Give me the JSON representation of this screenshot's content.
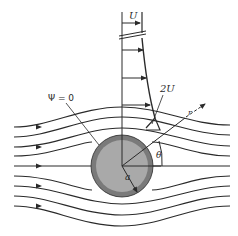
{
  "diagram": {
    "labels": {
      "free_stream": "U",
      "max_velocity": "2U",
      "dividing_streamline": "Ψ = 0",
      "radial_coordinate": "r",
      "angle": "θ",
      "radius": "a"
    },
    "colors": {
      "line": "#2a2a2a",
      "cylinder_outer": "#7a7a7a",
      "cylinder_inner": "#a9a9a9",
      "background": "#ffffff"
    },
    "streamlines_count": 9,
    "velocity_profile_arrows": 4
  }
}
